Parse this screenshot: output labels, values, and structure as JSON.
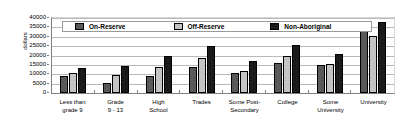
{
  "chart_data": {
    "type": "bar",
    "title": "",
    "xlabel": "",
    "ylabel": "dollars",
    "ylim": [
      0,
      40000
    ],
    "ytick_step": 5000,
    "yticks": [
      "40000",
      "35000",
      "30000",
      "25000",
      "20000",
      "15000",
      "10000",
      "5000",
      "0"
    ],
    "grid": true,
    "legend_position": "top-inside",
    "categories": [
      "Less than grade 9",
      "Grade 9 - 13",
      "High School",
      "Trades",
      "Some Post-Secondary",
      "College",
      "Some University",
      "University"
    ],
    "category_lines": [
      [
        "Less than",
        "grade 9"
      ],
      [
        "Grade",
        "9 - 13"
      ],
      [
        "High",
        "School"
      ],
      [
        "Trades"
      ],
      [
        "Some Post-",
        "Secondary"
      ],
      [
        "College"
      ],
      [
        "Some",
        "University"
      ],
      [
        "University"
      ]
    ],
    "series": [
      {
        "name": "On-Reserve",
        "color": "#595959",
        "values": [
          9000,
          5500,
          9000,
          13800,
          10500,
          16200,
          15200,
          33000
        ]
      },
      {
        "name": "Off-Reserve",
        "color": "#c4c4c4",
        "values": [
          10500,
          9500,
          13800,
          18600,
          12000,
          19700,
          15300,
          30300
        ]
      },
      {
        "name": "Non-Aboriginal",
        "color": "#1a1a1a",
        "values": [
          13500,
          14500,
          19500,
          25300,
          17300,
          25800,
          21000,
          37700
        ]
      }
    ]
  },
  "legend": {
    "items": [
      {
        "label": "On-Reserve"
      },
      {
        "label": "Off-Reserve"
      },
      {
        "label": "Non-Aboriginal"
      }
    ]
  },
  "axis": {
    "y_title": "dollars"
  }
}
